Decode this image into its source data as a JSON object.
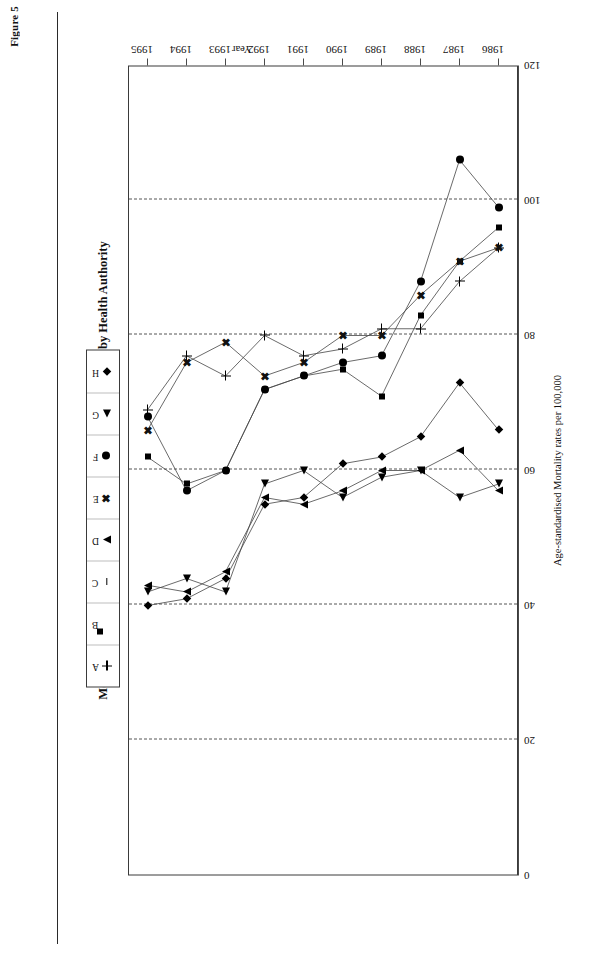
{
  "figure_label": "Figure 5",
  "title": "Mortality Rates from Coronary Heart Disease in people under 65 by Health Authority",
  "legend": {
    "items": [
      {
        "label": "A",
        "marker": "plus-icon"
      },
      {
        "label": "B",
        "marker": "filled-square-icon"
      },
      {
        "label": "C",
        "marker": "dash-icon"
      },
      {
        "label": "D",
        "marker": "triangle-up-icon"
      },
      {
        "label": "E",
        "marker": "cross-x-icon"
      },
      {
        "label": "F",
        "marker": "filled-circle-icon"
      },
      {
        "label": "G",
        "marker": "triangle-left-icon"
      },
      {
        "label": "H",
        "marker": "filled-diamond-icon"
      }
    ]
  },
  "chart_data": {
    "type": "line",
    "title": "Mortality Rates from Coronary Heart Disease in people under 65 by Health Authority",
    "xlabel": "Year",
    "ylabel": "Age-standardised Mortality rates per 100,000",
    "x": [
      1986,
      1987,
      1988,
      1989,
      1990,
      1991,
      1992,
      1993,
      1994,
      1995
    ],
    "xticklabels": [
      "1986",
      "1987",
      "1988",
      "1989",
      "1990",
      "1991",
      "1992",
      "1993",
      "1994",
      "1995"
    ],
    "yticklabels": [
      "0",
      "20",
      "40",
      "60",
      "80",
      "100",
      "120"
    ],
    "yticks": [
      0,
      20,
      40,
      60,
      80,
      100,
      120
    ],
    "ylim": [
      0,
      120
    ],
    "grid": "vertical-dashed",
    "legend_position": "top",
    "series": [
      {
        "name": "A",
        "marker": "plus-icon",
        "values": [
          93,
          88,
          81,
          81,
          78,
          77,
          80,
          74,
          77,
          69
        ]
      },
      {
        "name": "B",
        "marker": "filled-square-icon",
        "values": [
          96,
          91,
          83,
          71,
          75,
          74,
          72,
          60,
          58,
          62
        ]
      },
      {
        "name": "C",
        "marker": "dash-icon",
        "values": [
          null,
          null,
          null,
          null,
          null,
          null,
          null,
          null,
          null,
          null
        ]
      },
      {
        "name": "D",
        "marker": "triangle-up-icon",
        "values": [
          57,
          63,
          60,
          60,
          57,
          55,
          56,
          45,
          42,
          43
        ]
      },
      {
        "name": "E",
        "marker": "cross-x-icon",
        "values": [
          93,
          91,
          86,
          80,
          80,
          76,
          74,
          79,
          76,
          66
        ]
      },
      {
        "name": "F",
        "marker": "filled-circle-icon",
        "values": [
          99,
          106,
          88,
          77,
          76,
          74,
          72,
          60,
          57,
          68
        ]
      },
      {
        "name": "G",
        "marker": "triangle-left-icon",
        "values": [
          58,
          56,
          60,
          59,
          56,
          60,
          58,
          42,
          44,
          42
        ]
      },
      {
        "name": "H",
        "marker": "filled-diamond-icon",
        "values": [
          66,
          73,
          65,
          62,
          61,
          56,
          55,
          44,
          41,
          40
        ]
      }
    ]
  }
}
